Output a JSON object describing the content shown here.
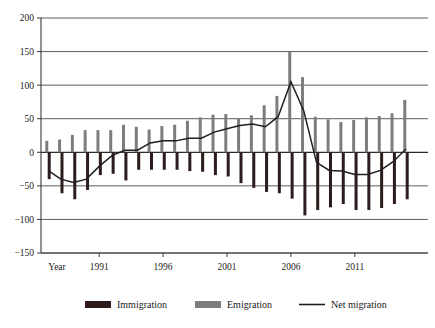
{
  "chart_data": {
    "type": "bar",
    "title": "",
    "xlabel": "Year",
    "ylabel": "",
    "ylim": [
      -150,
      200
    ],
    "ytick_values": [
      200,
      150,
      100,
      50,
      0,
      -50,
      -100,
      -150
    ],
    "ytick_labels": [
      "200",
      "150",
      "100",
      "50",
      "0",
      "−50",
      "−100",
      "−150"
    ],
    "xtick_values": [
      1991,
      1996,
      2001,
      2006,
      2011
    ],
    "xtick_labels": [
      "1991",
      "1996",
      "2001",
      "2006",
      "2011"
    ],
    "x_axis_origin_label": "Year",
    "grid": true,
    "grid_axis": "y",
    "legend_position": "bottom",
    "categories": [
      1987,
      1988,
      1989,
      1990,
      1991,
      1992,
      1993,
      1994,
      1995,
      1996,
      1997,
      1998,
      1999,
      2000,
      2001,
      2002,
      2003,
      2004,
      2005,
      2006,
      2007,
      2008,
      2009,
      2010,
      2011,
      2012,
      2013,
      2014,
      2015
    ],
    "series": [
      {
        "name": "Emigration",
        "color": "#7d7d7d",
        "values": [
          17,
          19,
          26,
          33,
          33,
          33,
          41,
          38,
          34,
          39,
          41,
          47,
          52,
          56,
          57,
          51,
          55,
          70,
          84,
          150,
          112,
          53,
          49,
          45,
          48,
          52,
          54,
          58,
          78
        ]
      },
      {
        "name": "Immigration",
        "color": "#2e1c1c",
        "values": [
          -40,
          -61,
          -70,
          -56,
          -34,
          -32,
          -42,
          -26,
          -26,
          -26,
          -26,
          -28,
          -29,
          -34,
          -36,
          -46,
          -53,
          -59,
          -61,
          -69,
          -94,
          -86,
          -82,
          -77,
          -86,
          -86,
          -83,
          -77,
          -70
        ]
      }
    ],
    "line_series": {
      "name": "Net migration",
      "color": "#1f1f1f",
      "values": [
        -27,
        -40,
        -45,
        -40,
        -21,
        -5,
        3,
        3,
        14,
        17,
        17,
        21,
        21,
        30,
        35,
        40,
        42,
        38,
        53,
        105,
        62,
        -15,
        -27,
        -28,
        -33,
        -33,
        -27,
        -14,
        5
      ]
    },
    "legend": [
      {
        "label": "Immigration",
        "type": "swatch",
        "color": "#2e1c1c"
      },
      {
        "label": "Emigration",
        "type": "swatch",
        "color": "#7d7d7d"
      },
      {
        "label": "Net migration",
        "type": "line",
        "color": "#1f1f1f"
      }
    ]
  }
}
